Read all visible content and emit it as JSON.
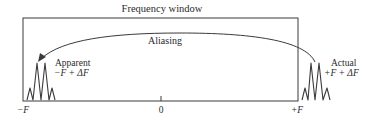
{
  "diagram": {
    "title": "Frequency window",
    "arrow_label": "Aliasing",
    "apparent": {
      "label": "Apparent",
      "expression": "−F + ΔF"
    },
    "actual": {
      "label": "Actual",
      "expression": "+F + ΔF"
    },
    "axis": {
      "left": "−F",
      "center": "0",
      "right": "+F"
    },
    "colors": {
      "stroke": "#3a3a3a",
      "text": "#2a2a2a",
      "background": "#ffffff"
    }
  }
}
